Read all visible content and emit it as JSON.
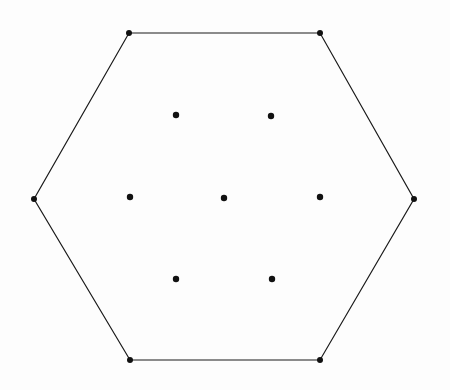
{
  "figure": {
    "type": "geometric-diagram",
    "width": 450,
    "height": 390,
    "background_color": "#fdfdfd",
    "stroke_color": "#1a1a1a",
    "dot_color": "#111111",
    "edge_stroke_width": 1.2,
    "vertex_dot_radius": 3.0,
    "interior_dot_radius": 3.2
  },
  "chart_data": {
    "type": "scatter",
    "xlabel": "",
    "ylabel": "",
    "grid": false,
    "legend": false,
    "xlim": [
      0,
      450
    ],
    "ylim": [
      390,
      0
    ],
    "series": [
      {
        "name": "hexagon-vertices",
        "marker": "filled-circle",
        "color": "#111111",
        "points": [
          {
            "label": "top-left",
            "x": 129,
            "y": 33
          },
          {
            "label": "top-right",
            "x": 320,
            "y": 33
          },
          {
            "label": "right",
            "x": 414,
            "y": 199
          },
          {
            "label": "bottom-right",
            "x": 320,
            "y": 360
          },
          {
            "label": "bottom-left",
            "x": 130,
            "y": 360
          },
          {
            "label": "left",
            "x": 34,
            "y": 199
          }
        ]
      },
      {
        "name": "interior-points",
        "marker": "filled-circle",
        "color": "#111111",
        "points": [
          {
            "label": "upper-left",
            "x": 176,
            "y": 115
          },
          {
            "label": "upper-right",
            "x": 271,
            "y": 116
          },
          {
            "label": "middle-left",
            "x": 130,
            "y": 197
          },
          {
            "label": "center",
            "x": 224,
            "y": 198
          },
          {
            "label": "middle-right",
            "x": 320,
            "y": 197
          },
          {
            "label": "lower-left",
            "x": 176,
            "y": 279
          },
          {
            "label": "lower-right",
            "x": 272,
            "y": 279
          }
        ]
      }
    ],
    "shapes": [
      {
        "name": "hexagon-outline",
        "type": "polygon",
        "closed": true,
        "stroke": "#1a1a1a",
        "stroke_width": 1.2,
        "fill": "none",
        "vertices": [
          [
            129,
            33
          ],
          [
            320,
            33
          ],
          [
            414,
            199
          ],
          [
            320,
            360
          ],
          [
            130,
            360
          ],
          [
            34,
            199
          ]
        ]
      }
    ],
    "annotations": []
  }
}
